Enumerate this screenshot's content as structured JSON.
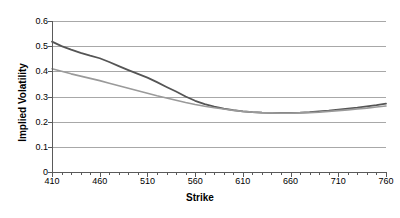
{
  "chart_data": {
    "type": "line",
    "title": "",
    "xlabel": "Strike",
    "ylabel": "Implied Volatility",
    "xlim": [
      410,
      760
    ],
    "ylim": [
      0,
      0.6
    ],
    "grid": true,
    "legend": "none",
    "y_ticks": [
      "0",
      "0.1",
      "0.2",
      "0.3",
      "0.4",
      "0.5",
      "0.6"
    ],
    "y_tick_values": [
      0,
      0.1,
      0.2,
      0.3,
      0.4,
      0.5,
      0.6
    ],
    "x_ticks": [
      "410",
      "460",
      "510",
      "560",
      "610",
      "660",
      "710",
      "760"
    ],
    "x_tick_values": [
      410,
      460,
      510,
      560,
      610,
      660,
      710,
      760
    ],
    "x_minor_step": 10,
    "series": [
      {
        "name": "market-implied-volatility",
        "color": "#555555",
        "width": 1.8,
        "x": [
          410,
          420,
          430,
          440,
          450,
          460,
          470,
          480,
          490,
          500,
          510,
          520,
          530,
          540,
          550,
          560,
          570,
          580,
          590,
          600,
          610,
          620,
          630,
          640,
          650,
          660,
          670,
          680,
          690,
          700,
          710,
          720,
          730,
          740,
          750,
          760
        ],
        "y": [
          0.518,
          0.5,
          0.486,
          0.473,
          0.462,
          0.452,
          0.437,
          0.421,
          0.405,
          0.39,
          0.375,
          0.357,
          0.338,
          0.32,
          0.3,
          0.283,
          0.27,
          0.26,
          0.252,
          0.246,
          0.241,
          0.238,
          0.236,
          0.235,
          0.235,
          0.235,
          0.236,
          0.238,
          0.241,
          0.244,
          0.248,
          0.252,
          0.256,
          0.261,
          0.266,
          0.272
        ]
      },
      {
        "name": "model-implied-volatility",
        "color": "#9a9a9a",
        "width": 1.6,
        "x": [
          410,
          420,
          430,
          440,
          450,
          460,
          470,
          480,
          490,
          500,
          510,
          520,
          530,
          540,
          550,
          560,
          570,
          580,
          590,
          600,
          610,
          620,
          630,
          640,
          650,
          660,
          670,
          680,
          690,
          700,
          710,
          720,
          730,
          740,
          750,
          760
        ],
        "y": [
          0.41,
          0.4,
          0.39,
          0.381,
          0.372,
          0.363,
          0.353,
          0.343,
          0.333,
          0.323,
          0.313,
          0.303,
          0.294,
          0.285,
          0.276,
          0.268,
          0.261,
          0.255,
          0.25,
          0.245,
          0.241,
          0.238,
          0.236,
          0.235,
          0.234,
          0.234,
          0.235,
          0.236,
          0.238,
          0.241,
          0.244,
          0.247,
          0.251,
          0.254,
          0.258,
          0.262
        ]
      }
    ]
  },
  "axes": {
    "x_title": "Strike",
    "y_title": "Implied Volatility"
  },
  "colors": {
    "grid": "#a8a8a8",
    "axis": "#5a5a5a",
    "series_dark": "#555555",
    "series_light": "#9a9a9a",
    "background": "#ffffff"
  }
}
